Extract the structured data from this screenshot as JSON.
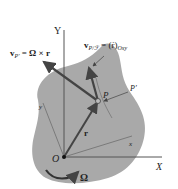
{
  "diagram": {
    "colors": {
      "body_fill": "#a9a9a9",
      "vector": "#444444",
      "axis": "#555555",
      "text": "#222222"
    },
    "labels": {
      "axis_X": "X",
      "axis_Y": "Y",
      "axis_x": "x",
      "axis_y": "y",
      "origin": "O",
      "point_P": "P",
      "point_P_prime": "P′",
      "position_vector": "r",
      "angular_velocity": "Ω",
      "v_P_prime": "v",
      "v_P_prime_sub": "P′",
      "v_P_prime_eq": " = Ω × r",
      "v_P_rel": "v",
      "v_P_rel_sub": "P/ℱ",
      "v_P_rel_eq": " = (ṙ)",
      "v_P_rel_eq_sub": "Oxy"
    }
  }
}
